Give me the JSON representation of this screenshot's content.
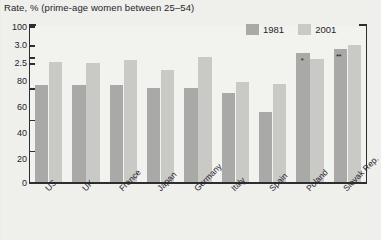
{
  "chart_data": {
    "type": "bar",
    "title": "Rate, % (prime-age women between 25–54)",
    "xlabel": "",
    "ylabel": "",
    "ylim": [
      0,
      100
    ],
    "yticks": [
      0,
      20,
      40,
      60,
      80,
      100
    ],
    "ytick_labels": [
      "0",
      "20",
      "40",
      "60",
      "80",
      "2.5",
      "3.0",
      "100"
    ],
    "grid": false,
    "legend_position": "top-right",
    "categories": [
      "US",
      "UK",
      "France",
      "Japan",
      "Germany",
      "Italy",
      "Spain",
      "Poland",
      "Slovak Rep."
    ],
    "series": [
      {
        "name": "1981",
        "color": "#a9a9a7",
        "values": [
          62,
          62,
          62,
          60,
          60,
          57,
          45,
          83,
          85
        ]
      },
      {
        "name": "2001",
        "color": "#c9c9c6",
        "values": [
          77,
          76,
          78,
          72,
          80,
          64,
          63,
          79,
          88
        ]
      }
    ],
    "annotations": [
      {
        "label": "*",
        "category": "Poland",
        "series": "1981"
      },
      {
        "label": "**",
        "category": "Slovak Rep.",
        "series": "1981"
      }
    ]
  },
  "legend": {
    "items": [
      {
        "label": "1981",
        "swatch": "#a9a9a7"
      },
      {
        "label": "2001",
        "swatch": "#c9c9c6"
      }
    ]
  },
  "axis": {
    "y_labels": [
      "100",
      "3.0",
      "2.5",
      "80",
      "60",
      "40",
      "20",
      "0"
    ]
  }
}
